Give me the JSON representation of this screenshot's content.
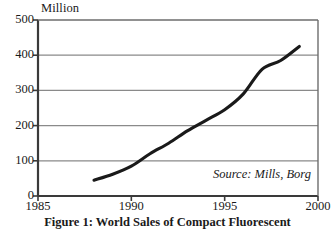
{
  "figure": {
    "caption": "Figure 1: World Sales of Compact Fluorescent",
    "source_note": "Source: Mills, Borg",
    "unit_label": "Million"
  },
  "chart_data": {
    "type": "line",
    "title": "Figure 1: World Sales of Compact Fluorescent",
    "xlabel": "",
    "ylabel": "Million",
    "xlim": [
      1985,
      2000
    ],
    "ylim": [
      0,
      500
    ],
    "xticks": [
      1985,
      1990,
      1995,
      2000
    ],
    "yticks": [
      0,
      100,
      200,
      300,
      400,
      500
    ],
    "grid": "horizontal",
    "legend": "none",
    "annotations": [
      "Source: Mills, Borg"
    ],
    "line_color": "#1a1a1a",
    "grid_color": "#8a8a8a",
    "axis_color": "#3a3a3a",
    "background": "#ffffff",
    "series": [
      {
        "name": "World sales of compact fluorescent lamps",
        "x": [
          1988,
          1989,
          1990,
          1991,
          1992,
          1993,
          1994,
          1995,
          1996,
          1997,
          1998,
          1999
        ],
        "values": [
          45,
          62,
          85,
          120,
          150,
          185,
          215,
          245,
          290,
          360,
          385,
          425
        ]
      }
    ]
  }
}
